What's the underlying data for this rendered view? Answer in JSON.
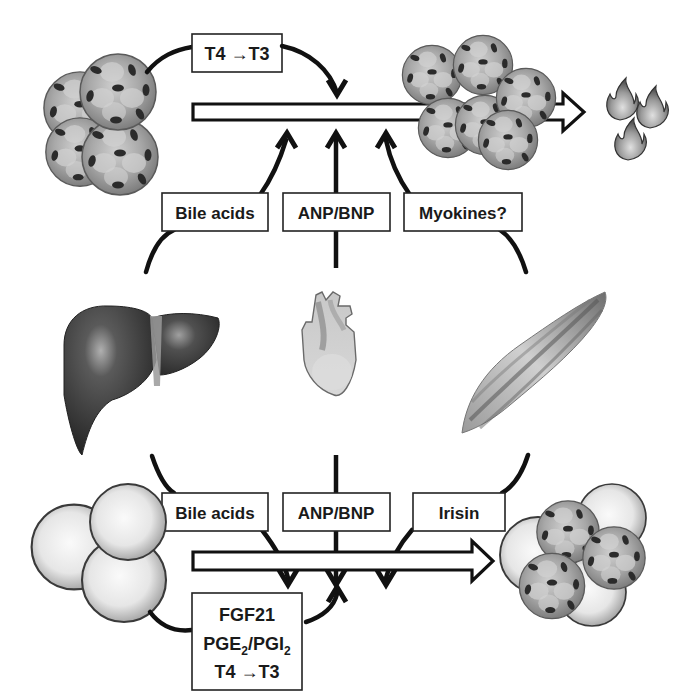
{
  "diagram": {
    "top_pathway": {
      "description": "brown adipocytes to thermogenesis",
      "autocrine_label": "T4 →T3",
      "inputs": [
        {
          "label": "Bile acids",
          "source": "liver"
        },
        {
          "label": "ANP/BNP",
          "source": "heart"
        },
        {
          "label": "Myokines?",
          "source": "muscle"
        }
      ],
      "output_icon": "flame-icon"
    },
    "bottom_pathway": {
      "description": "white adipocytes to beige adipocytes",
      "inputs": [
        {
          "label": "Bile acids",
          "source": "liver"
        },
        {
          "label": "ANP/BNP",
          "source": "heart"
        },
        {
          "label": "Irisin",
          "source": "muscle"
        }
      ],
      "autocrine_box": {
        "line1": "FGF21",
        "line2_a": "PGE",
        "line2_sub_a": "2",
        "line2_sep": "/PGI",
        "line2_sub_b": "2",
        "line3": "T4 →T3"
      }
    },
    "organs": [
      {
        "name": "liver",
        "icon": "liver-icon"
      },
      {
        "name": "heart",
        "icon": "heart-icon"
      },
      {
        "name": "muscle",
        "icon": "muscle-icon"
      }
    ],
    "colors": {
      "stroke": "#111111",
      "brown_cell": "#8c8c8c",
      "white_cell": "#e8e8e8",
      "nucleus": "#2b2b2b",
      "liver": "#3a3a3a",
      "background": "#ffffff"
    }
  }
}
